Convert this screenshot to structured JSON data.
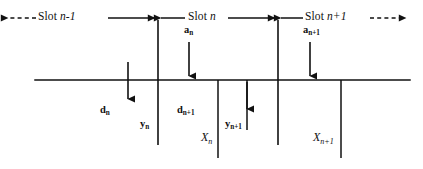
{
  "figure": {
    "type": "timing-diagram",
    "line_color": "#111111",
    "background_color": "#ffffff"
  },
  "axis": {
    "name": "time-axis",
    "y": 80,
    "x_start": 35,
    "x_end": 410
  },
  "slots": [
    {
      "id": "slot-n-minus-1",
      "label_prefix": "Slot ",
      "label_main": "n-1",
      "label_full": "Slot n-1",
      "text_x": 38,
      "text_y": 14,
      "arrow_style": "dashed-left",
      "boundary_right_x": 158
    },
    {
      "id": "slot-n",
      "label_prefix": "Slot ",
      "label_main": "n",
      "label_full": "Slot n",
      "text_x": 188,
      "text_y": 14,
      "arrow_style": "solid-both",
      "boundary_left_x": 158,
      "boundary_right_x": 278
    },
    {
      "id": "slot-n-plus-1",
      "label_prefix": "Slot ",
      "label_main": "n+1",
      "label_full": "Slot n+1",
      "text_x": 305,
      "text_y": 14,
      "arrow_style": "solid-left-dashed-right",
      "boundary_left_x": 278
    }
  ],
  "boundaries": [
    {
      "id": "boundary-n",
      "x": 158,
      "y_top": 20,
      "y_bottom": 145
    },
    {
      "id": "boundary-n-plus-1",
      "x": 278,
      "y_top": 20,
      "y_bottom": 145
    }
  ],
  "ticks": [
    {
      "id": "tick-x-n",
      "x": 218,
      "y_top": 80,
      "y_bottom": 158
    },
    {
      "id": "tick-y-n-plus-1",
      "x": 247,
      "y_top": 80,
      "y_bottom": 130
    },
    {
      "id": "tick-x-n-plus-1",
      "x": 341,
      "y_top": 80,
      "y_bottom": 158
    }
  ],
  "arrows": [
    {
      "id": "arrow-d-n",
      "x": 128,
      "y_from": 62,
      "y_to": 103,
      "direction": "down"
    },
    {
      "id": "arrow-a-n",
      "x": 189,
      "y_from": 42,
      "y_to": 80,
      "direction": "down"
    },
    {
      "id": "arrow-y-n-plus-1",
      "x": 247,
      "y_from": 80,
      "y_to": 113,
      "direction": "down"
    },
    {
      "id": "arrow-a-n-plus-1",
      "x": 310,
      "y_from": 42,
      "y_to": 80,
      "direction": "down"
    }
  ],
  "variables": [
    {
      "id": "label-a-n",
      "base": "a",
      "sub": "n",
      "text": "an",
      "x": 184,
      "y": 30,
      "style": "var"
    },
    {
      "id": "label-a-n-plus-1",
      "base": "a",
      "sub": "n+1",
      "text": "an+1",
      "x": 303,
      "y": 30,
      "style": "var"
    },
    {
      "id": "label-d-n",
      "base": "d",
      "sub": "n",
      "text": "dn",
      "x": 100,
      "y": 110,
      "style": "var"
    },
    {
      "id": "label-y-n",
      "base": "y",
      "sub": "n",
      "text": "yn",
      "x": 140,
      "y": 124,
      "style": "var"
    },
    {
      "id": "label-d-n-plus-1",
      "base": "d",
      "sub": "n+1",
      "text": "dn+1",
      "x": 177,
      "y": 110,
      "style": "var"
    },
    {
      "id": "label-y-n-plus-1",
      "base": "y",
      "sub": "n+1",
      "text": "yn+1",
      "x": 225,
      "y": 124,
      "style": "var"
    },
    {
      "id": "label-x-n",
      "base": "X",
      "sub": "n",
      "text": "Xn",
      "x": 200,
      "y": 135,
      "style": "x"
    },
    {
      "id": "label-x-n-plus-1",
      "base": "X",
      "sub": "n+1",
      "text": "Xn+1",
      "x": 313,
      "y": 135,
      "style": "x"
    }
  ]
}
